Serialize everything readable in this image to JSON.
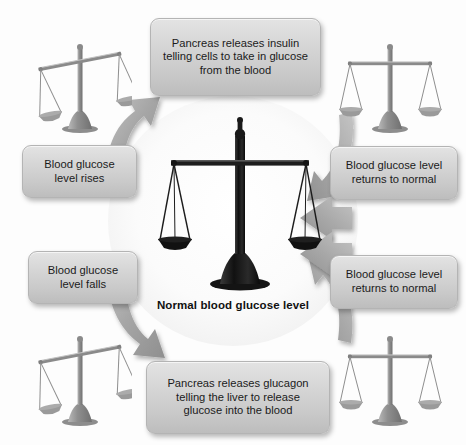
{
  "diagram": {
    "caption": "Normal blood glucose level",
    "boxes": {
      "insulin": {
        "line1": "Pancreas releases insulin",
        "line2": "telling cells to take in glucose",
        "line3": "from the blood"
      },
      "glucagon": {
        "line1": "Pancreas releases glucagon",
        "line2": "telling the liver to release",
        "line3": "glucose into the blood"
      },
      "rises": {
        "line1": "Blood glucose",
        "line2": "level rises"
      },
      "falls": {
        "line1": "Blood glucose",
        "line2": "level falls"
      },
      "normal_top": {
        "line1": "Blood glucose level",
        "line2": "returns to normal"
      },
      "normal_bottom": {
        "line1": "Blood glucose level",
        "line2": "returns to normal"
      }
    },
    "icons": {
      "scale_center": "balance-scale-balanced-icon",
      "scale_top_left": "balance-scale-tilted-left-icon",
      "scale_top_right": "balance-scale-balanced-icon",
      "scale_bottom_left": "balance-scale-tilted-left-icon",
      "scale_bottom_right": "balance-scale-balanced-icon",
      "arrow_up_right": "curved-arrow-up-right-icon",
      "arrow_down_right": "curved-arrow-down-right-icon",
      "arrow_left_upper": "arrow-left-icon",
      "arrow_left_lower": "arrow-left-icon",
      "arrow_in_top_right": "curved-arrow-down-left-icon",
      "arrow_in_bottom_right": "curved-arrow-up-left-icon"
    },
    "colors": {
      "box_fill_top": "#e3e3e3",
      "box_fill_bottom": "#bdbdbd",
      "box_border": "#b4b4b4",
      "arrow_fill": "#a8a8a8",
      "text": "#1b1b1b",
      "background": "#ffffff"
    }
  }
}
